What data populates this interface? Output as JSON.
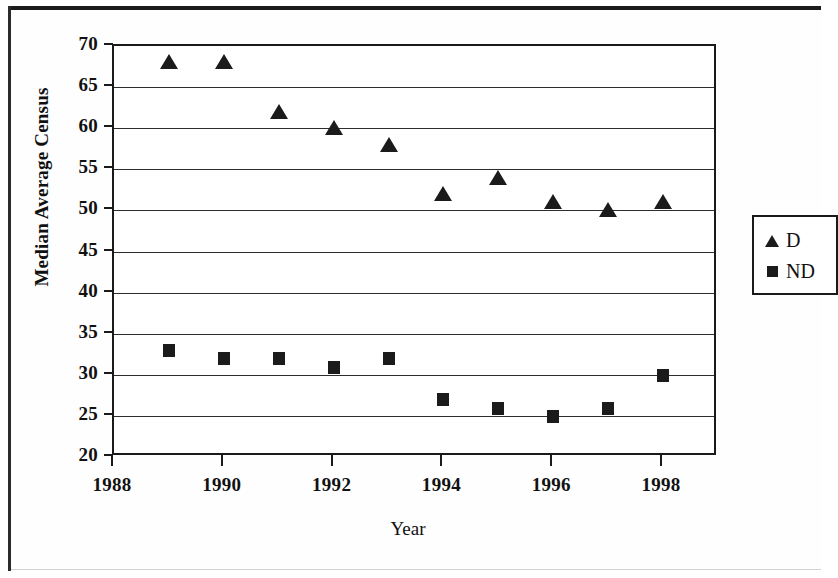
{
  "chart_data": {
    "type": "scatter",
    "title": "",
    "xlabel": "Year",
    "ylabel": "Median Average Census",
    "xlim": [
      1988,
      1999
    ],
    "ylim": [
      20,
      70
    ],
    "xticks": [
      1988,
      1990,
      1992,
      1994,
      1996,
      1998
    ],
    "xtick_labels": [
      "1988",
      "1990",
      "1992",
      "1994",
      "1996",
      "1998"
    ],
    "yticks": [
      20,
      25,
      30,
      35,
      40,
      45,
      50,
      55,
      60,
      65,
      70
    ],
    "ytick_labels": [
      "20",
      "25",
      "30",
      "35",
      "40",
      "45",
      "50",
      "55",
      "60",
      "65",
      "70"
    ],
    "grid": "horizontal",
    "legend_position": "right",
    "x": [
      1989,
      1990,
      1991,
      1992,
      1993,
      1994,
      1995,
      1996,
      1997,
      1998
    ],
    "series": [
      {
        "name": "D",
        "marker": "triangle",
        "color": "#1b1b1b",
        "values": [
          68,
          68,
          62,
          60,
          58,
          52,
          54,
          51,
          50,
          51
        ]
      },
      {
        "name": "ND",
        "marker": "square",
        "color": "#1b1b1b",
        "values": [
          33,
          32,
          32,
          31,
          32,
          27,
          26,
          25,
          26,
          30
        ]
      }
    ]
  },
  "legend": {
    "entries": [
      {
        "label": "D",
        "marker": "triangle-icon"
      },
      {
        "label": "ND",
        "marker": "square-icon"
      }
    ]
  },
  "colors": {
    "ink": "#1b1b1b",
    "grid": "#2d2d2d",
    "page": "#ffffff"
  }
}
